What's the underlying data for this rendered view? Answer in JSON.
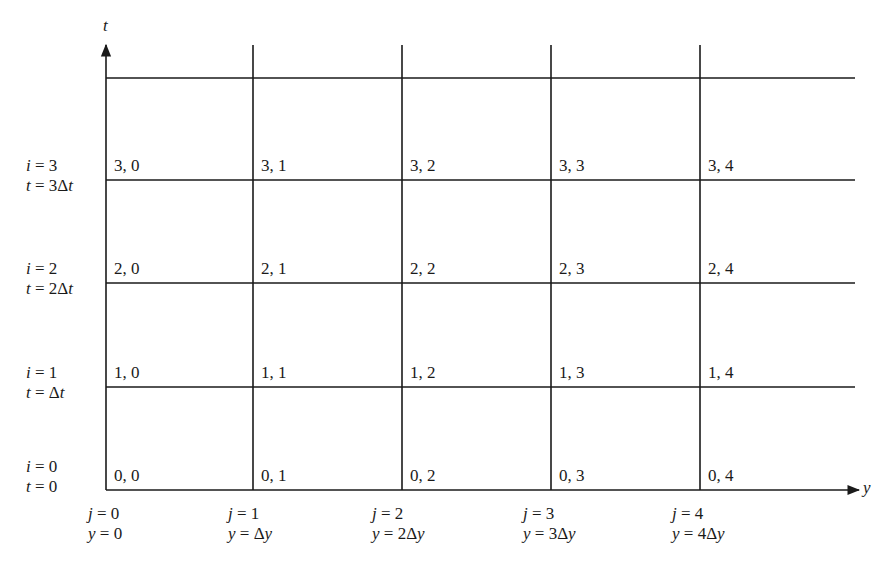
{
  "diagram": {
    "type": "finite-difference-grid",
    "axes": {
      "vertical": {
        "label": "t",
        "x": 106,
        "y_top": 45,
        "y_bottom": 490
      },
      "horizontal": {
        "label": "y",
        "y": 490,
        "x_left": 106,
        "x_right": 855
      }
    },
    "grid": {
      "vertical_lines_x": [
        106,
        253,
        402,
        551,
        700
      ],
      "vertical_line_top": 45,
      "horizontal_lines_y": [
        78,
        180,
        283,
        387,
        490
      ],
      "horizontal_line_right": 855
    },
    "row_labels": [
      {
        "i": "i = 3",
        "t": "t = 3Δt",
        "y": 160
      },
      {
        "i": "i = 2",
        "t": "t = 2Δt",
        "y": 263
      },
      {
        "i": "i = 1",
        "t": "t = Δt",
        "y": 367
      },
      {
        "i": "i = 0",
        "t": "t = 0",
        "y": 461
      }
    ],
    "column_labels": [
      {
        "j": "j = 0",
        "y": "y = 0",
        "x": 88
      },
      {
        "j": "j = 1",
        "y": "y = Δy",
        "x": 228
      },
      {
        "j": "j = 2",
        "y": "y = 2Δy",
        "x": 372
      },
      {
        "j": "j = 3",
        "y": "y = 3Δy",
        "x": 523
      },
      {
        "j": "j = 4",
        "y": "y = 4Δy",
        "x": 672
      }
    ],
    "nodes": [
      [
        "3, 0",
        "3, 1",
        "3, 2",
        "3, 3",
        "3, 4"
      ],
      [
        "2, 0",
        "2, 1",
        "2, 2",
        "2, 3",
        "2, 4"
      ],
      [
        "1, 0",
        "1, 1",
        "1, 2",
        "1, 3",
        "1, 4"
      ],
      [
        "0, 0",
        "0, 1",
        "0, 2",
        "0, 3",
        "0, 4"
      ]
    ]
  }
}
